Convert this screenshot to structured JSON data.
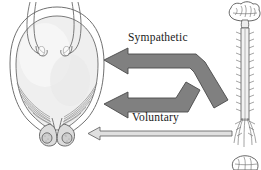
{
  "figure": {
    "background_color": "#ffffff",
    "width": 261,
    "height": 170
  },
  "labels": {
    "sympathetic": "Sympathetic",
    "voluntary": "Voluntary"
  },
  "anatomy": {
    "bladder": {
      "name": "urinary bladder",
      "fill_color": "#efefef",
      "outline_color": "#6b6b6b"
    },
    "ureters": {
      "name": "ureters",
      "count": 2,
      "outline_color": "#6b6b6b"
    },
    "detrusor_fibers": {
      "name": "detrusor muscle fibers",
      "outline_color": "#7a7a7a"
    },
    "sphincter": {
      "name": "urethral sphincter",
      "count": 2,
      "fill_color": "#d9d9d9"
    },
    "brain": {
      "name": "brain",
      "outline_color": "#555555"
    },
    "spinal_cord": {
      "name": "spinal cord",
      "outline_color": "#555555"
    },
    "cauda_equina": {
      "name": "cauda equina nerve roots",
      "outline_color": "#666666"
    },
    "lower_brain": {
      "name": "lower brain inset",
      "outline_color": "#555555"
    }
  },
  "arrows": {
    "sympathetic": {
      "name": "sympathetic-pathway-arrow",
      "direction": "left",
      "fill_color": "#808080",
      "stroke_color": "#4a4a4a"
    },
    "parasympathetic": {
      "name": "parasympathetic-pathway-arrow",
      "direction": "left",
      "fill_color": "#808080",
      "stroke_color": "#4a4a4a"
    },
    "voluntary": {
      "name": "voluntary-pathway-arrow",
      "direction": "left",
      "fill_color": "#e0e0e0",
      "stroke_color": "#5a5a5a"
    }
  }
}
